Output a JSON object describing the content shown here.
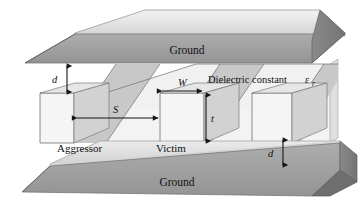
{
  "figure": {
    "type": "technical-3d-diagram",
    "canvas": {
      "width": 363,
      "height": 201
    },
    "background_color": "#ffffff"
  },
  "labels": {
    "ground_top": "Ground",
    "ground_bottom": "Ground",
    "aggressor": "Aggressor",
    "victim": "Victim",
    "dielectric": "Dielectric constant",
    "dielectric_symbol": "ε",
    "dielectric_subscript": "r"
  },
  "dimensions": [
    {
      "name": "d-top",
      "symbol": "d",
      "meaning": "spacing from top ground plane to conductor top",
      "orientation": "vertical"
    },
    {
      "name": "d-bottom",
      "symbol": "d",
      "meaning": "spacing from conductor bottom to bottom ground plane",
      "orientation": "vertical"
    },
    {
      "name": "S",
      "symbol": "S",
      "meaning": "edge-to-edge spacing between aggressor and victim",
      "orientation": "horizontal"
    },
    {
      "name": "W",
      "symbol": "W",
      "meaning": "conductor width",
      "orientation": "horizontal"
    },
    {
      "name": "t",
      "symbol": "t",
      "meaning": "conductor thickness",
      "orientation": "vertical"
    }
  ],
  "conductors": [
    {
      "name": "aggressor",
      "label": "Aggressor",
      "index": 0
    },
    {
      "name": "victim",
      "label": "Victim",
      "index": 1
    },
    {
      "name": "unlabeled-third",
      "label": "",
      "index": 2
    }
  ],
  "colors": {
    "ground_top_face": "#e4e4e4",
    "ground_front_face": "#9e9e9e",
    "ground_end_cap": "#7e7e7e",
    "dielectric_light": "#f0f0f0",
    "dielectric_shade": "#c9c9c9",
    "conductor_face": "#f4f4f4",
    "conductor_top": "#dcdcdc",
    "conductor_side": "#c4c4c4",
    "outline": "#6f6f6f",
    "text": "#111111",
    "arrow": "#151515"
  }
}
